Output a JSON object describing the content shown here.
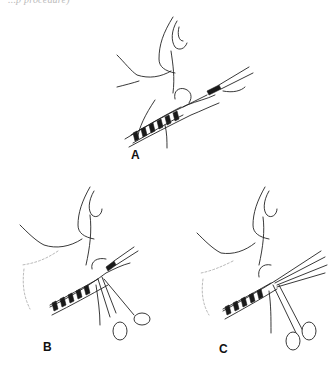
{
  "figure": {
    "top_caption_fragment": "...p procedure)",
    "panels": [
      {
        "id": "A",
        "label": "A",
        "description": "Neck with spiral device and grasping instrument inserted"
      },
      {
        "id": "B",
        "label": "B",
        "description": "Neck with spiral device and scissors-type forceps applied"
      },
      {
        "id": "C",
        "label": "C",
        "description": "Neck with spiral device, forceps and fanned threads"
      }
    ]
  },
  "colors": {
    "line": "#222222",
    "background": "#ffffff",
    "label": "#111111"
  }
}
